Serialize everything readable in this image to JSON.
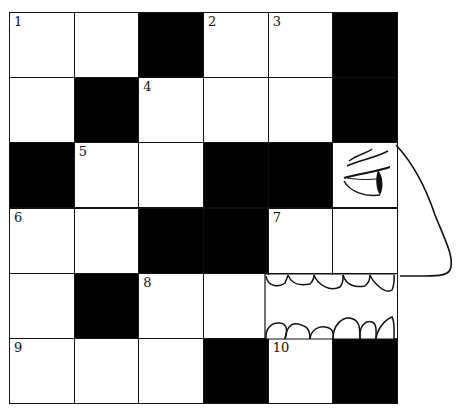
{
  "puzzle": {
    "type": "crossword",
    "rows": 6,
    "cols": 6,
    "cells": [
      [
        {
          "n": "1"
        },
        {
          "n": ""
        },
        {
          "b": true
        },
        {
          "n": "2"
        },
        {
          "n": "3"
        },
        {
          "b": true
        }
      ],
      [
        {
          "n": ""
        },
        {
          "b": true
        },
        {
          "n": "4"
        },
        {
          "n": ""
        },
        {
          "n": ""
        },
        {
          "b": true
        }
      ],
      [
        {
          "b": true
        },
        {
          "n": "5"
        },
        {
          "n": ""
        },
        {
          "b": true
        },
        {
          "b": true
        },
        {
          "n": "",
          "art": "eye"
        }
      ],
      [
        {
          "n": "6"
        },
        {
          "n": ""
        },
        {
          "b": true
        },
        {
          "b": true
        },
        {
          "n": "7"
        },
        {
          "n": ""
        }
      ],
      [
        {
          "n": ""
        },
        {
          "b": true
        },
        {
          "n": "8"
        },
        {
          "n": ""
        },
        {
          "n": "",
          "art": "teeth"
        },
        {
          "n": "",
          "art": "teeth"
        }
      ],
      [
        {
          "n": "9"
        },
        {
          "n": ""
        },
        {
          "n": ""
        },
        {
          "b": true
        },
        {
          "n": "10"
        },
        {
          "b": true
        }
      ]
    ],
    "clue_numbers": [
      "1",
      "2",
      "3",
      "4",
      "5",
      "6",
      "7",
      "8",
      "9",
      "10"
    ],
    "decorations": [
      "eye-illustration",
      "nose-profile-outline",
      "teeth-mouth-illustration"
    ]
  }
}
